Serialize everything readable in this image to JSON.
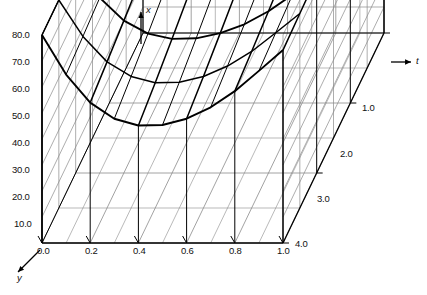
{
  "figure": {
    "kind": "3d-surface-mesh",
    "background": "#ffffff",
    "line_color": "#000000",
    "grid_color": "#8a8a8a"
  },
  "axes": {
    "vertical": {
      "name": "x",
      "arrow": "up",
      "ticks": [
        "80.0",
        "70.0",
        "60.0",
        "50.0",
        "40.0",
        "30.0",
        "20.0",
        "10.0"
      ],
      "tick_values": [
        80,
        70,
        60,
        50,
        40,
        30,
        20,
        10
      ],
      "range": [
        0,
        80
      ]
    },
    "horizontal": {
      "name": "y",
      "arrow": "down-left",
      "ticks": [
        "0.0",
        "0.2",
        "0.4",
        "0.6",
        "0.8",
        "1.0"
      ],
      "tick_values": [
        0.0,
        0.2,
        0.4,
        0.6,
        0.8,
        1.0
      ],
      "range": [
        0,
        1
      ]
    },
    "depth": {
      "name": "t",
      "arrow": "right",
      "ticks": [
        "1.0",
        "2.0",
        "3.0",
        "4.0"
      ],
      "tick_values": [
        1.0,
        2.0,
        3.0,
        4.0
      ],
      "range": [
        1,
        4
      ]
    }
  },
  "chart_data": {
    "type": "line",
    "title": "",
    "xlabel": "y",
    "ylabel": "x",
    "zlabel": "t",
    "grid": true,
    "legend": "none",
    "x": [
      0.0,
      0.1,
      0.2,
      0.3,
      0.4,
      0.5,
      0.6,
      0.7,
      0.8,
      0.9,
      1.0
    ],
    "xlim": [
      0,
      1
    ],
    "ylim": [
      0,
      80
    ],
    "zlim": [
      1,
      4
    ],
    "series": [
      {
        "name": "t = 1.0",
        "values": [
          80.0,
          74.2,
          71.0,
          69.6,
          69.2,
          69.4,
          70.0,
          71.2,
          73.0,
          75.6,
          79.0
        ]
      },
      {
        "name": "t = 1.5",
        "values": [
          80.0,
          72.2,
          67.4,
          65.0,
          64.2,
          64.4,
          65.4,
          67.2,
          69.8,
          73.4,
          78.0
        ]
      },
      {
        "name": "t = 2.0",
        "values": [
          80.0,
          70.4,
          64.2,
          60.8,
          59.6,
          59.8,
          61.2,
          63.6,
          67.0,
          71.6,
          77.0
        ]
      },
      {
        "name": "t = 2.5",
        "values": [
          80.0,
          68.8,
          61.2,
          57.0,
          55.4,
          55.6,
          57.2,
          60.2,
          64.4,
          70.0,
          76.2
        ]
      },
      {
        "name": "t = 3.0",
        "values": [
          80.0,
          67.4,
          58.6,
          53.6,
          51.6,
          51.8,
          53.8,
          57.2,
          62.2,
          68.6,
          75.4
        ]
      },
      {
        "name": "t = 3.5",
        "values": [
          80.0,
          66.0,
          56.2,
          50.6,
          48.2,
          48.4,
          50.6,
          54.6,
          60.2,
          67.4,
          74.8
        ]
      },
      {
        "name": "t = 4.0",
        "values": [
          80.0,
          64.8,
          54.0,
          47.8,
          45.2,
          45.4,
          47.8,
          52.2,
          58.4,
          66.2,
          74.2
        ]
      }
    ],
    "mesh_depth_lines": 6
  }
}
